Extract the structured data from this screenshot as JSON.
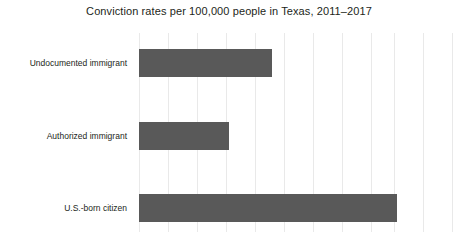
{
  "chart_data": {
    "type": "bar",
    "orientation": "horizontal",
    "title": "Conviction rates per 100,000 people in Texas, 2011–2017",
    "xlabel": "",
    "ylabel": "",
    "categories": [
      "Undocumented immigrant",
      "Authorized immigrant",
      "U.S.-born citizen"
    ],
    "values": [
      4.6,
      3.1,
      8.9
    ],
    "xlim": [
      0,
      10.8
    ],
    "grid": true,
    "gridline_count": 11,
    "legend": null,
    "tick_labels": [],
    "annotations": [],
    "bar_color": "#595959",
    "gridline_color": "#e9e9e9",
    "title_color": "#231f20",
    "background": "#ffffff"
  }
}
